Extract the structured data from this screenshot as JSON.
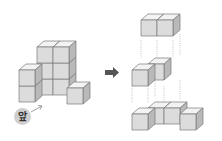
{
  "figure": {
    "front_label": "앞",
    "arrow": "right-arrow",
    "colors": {
      "front_face": "#dcdcdc",
      "top_face": "#f3f3f3",
      "side_face": "#b9b9b9",
      "edge": "#7a7a7a",
      "arrow": "#555555"
    },
    "original_structure": {
      "cube_count": 8,
      "layers": [
        {
          "level": 1,
          "cubes": 4
        },
        {
          "level": 2,
          "cubes": 2
        },
        {
          "level": 3,
          "cubes": 2
        }
      ]
    },
    "exploded_layers": [
      {
        "name": "top-layer",
        "cubes": 2
      },
      {
        "name": "middle-layer",
        "cubes": 2
      },
      {
        "name": "bottom-layer",
        "cubes": 4
      }
    ]
  }
}
